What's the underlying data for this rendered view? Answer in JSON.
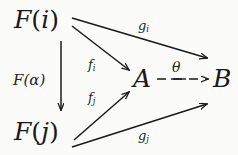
{
  "diagram": {
    "kind": "commutative-diagram",
    "background_color": "#fbfbfa",
    "ink_color": "#1a1a1a",
    "objects": [
      {
        "id": "Fi",
        "text": "F(i)",
        "base": "F",
        "arg": "i",
        "x": 14,
        "y": 7,
        "role": "source-upper-left"
      },
      {
        "id": "Fj",
        "text": "F(j)",
        "base": "F",
        "arg": "j",
        "x": 14,
        "y": 119,
        "role": "source-lower-left"
      },
      {
        "id": "A",
        "text": "A",
        "base": "A",
        "arg": "",
        "x": 133,
        "y": 66,
        "role": "middle-object"
      },
      {
        "id": "B",
        "text": "B",
        "base": "B",
        "arg": "",
        "x": 213,
        "y": 66,
        "role": "target-object"
      }
    ],
    "morphisms": [
      {
        "id": "Falpha",
        "label": "F(α)",
        "from": "Fi",
        "to": "Fj",
        "style": "solid",
        "label_x": 13,
        "label_y": 73
      },
      {
        "id": "fi",
        "label": "f",
        "sub": "i",
        "from": "Fi",
        "to": "A",
        "style": "solid",
        "label_x": 88,
        "label_y": 58
      },
      {
        "id": "fj",
        "label": "f",
        "sub": "j",
        "from": "Fj",
        "to": "A",
        "style": "solid",
        "label_x": 88,
        "label_y": 91
      },
      {
        "id": "gi",
        "label": "g",
        "sub": "i",
        "from": "Fi",
        "to": "B",
        "style": "solid",
        "label_x": 138,
        "label_y": 19
      },
      {
        "id": "gj",
        "label": "g",
        "sub": "j",
        "from": "Fj",
        "to": "B",
        "style": "solid",
        "label_x": 138,
        "label_y": 129
      },
      {
        "id": "theta",
        "label": "θ",
        "sub": "",
        "from": "A",
        "to": "B",
        "style": "dashed",
        "label_x": 172,
        "label_y": 59
      }
    ],
    "labels": {
      "Falpha": "F(α)",
      "fi_base": "f",
      "fi_sub": "i",
      "fj_base": "f",
      "fj_sub": "j",
      "gi_base": "g",
      "gi_sub": "i",
      "gj_base": "g",
      "gj_sub": "j",
      "theta": "θ",
      "Fi_base": "F",
      "Fi_open": "(",
      "Fi_arg": "i",
      "Fi_close": ")",
      "Fj_base": "F",
      "Fj_open": "(",
      "Fj_arg": "j",
      "Fj_close": ")",
      "A": "A",
      "B": "B"
    }
  }
}
